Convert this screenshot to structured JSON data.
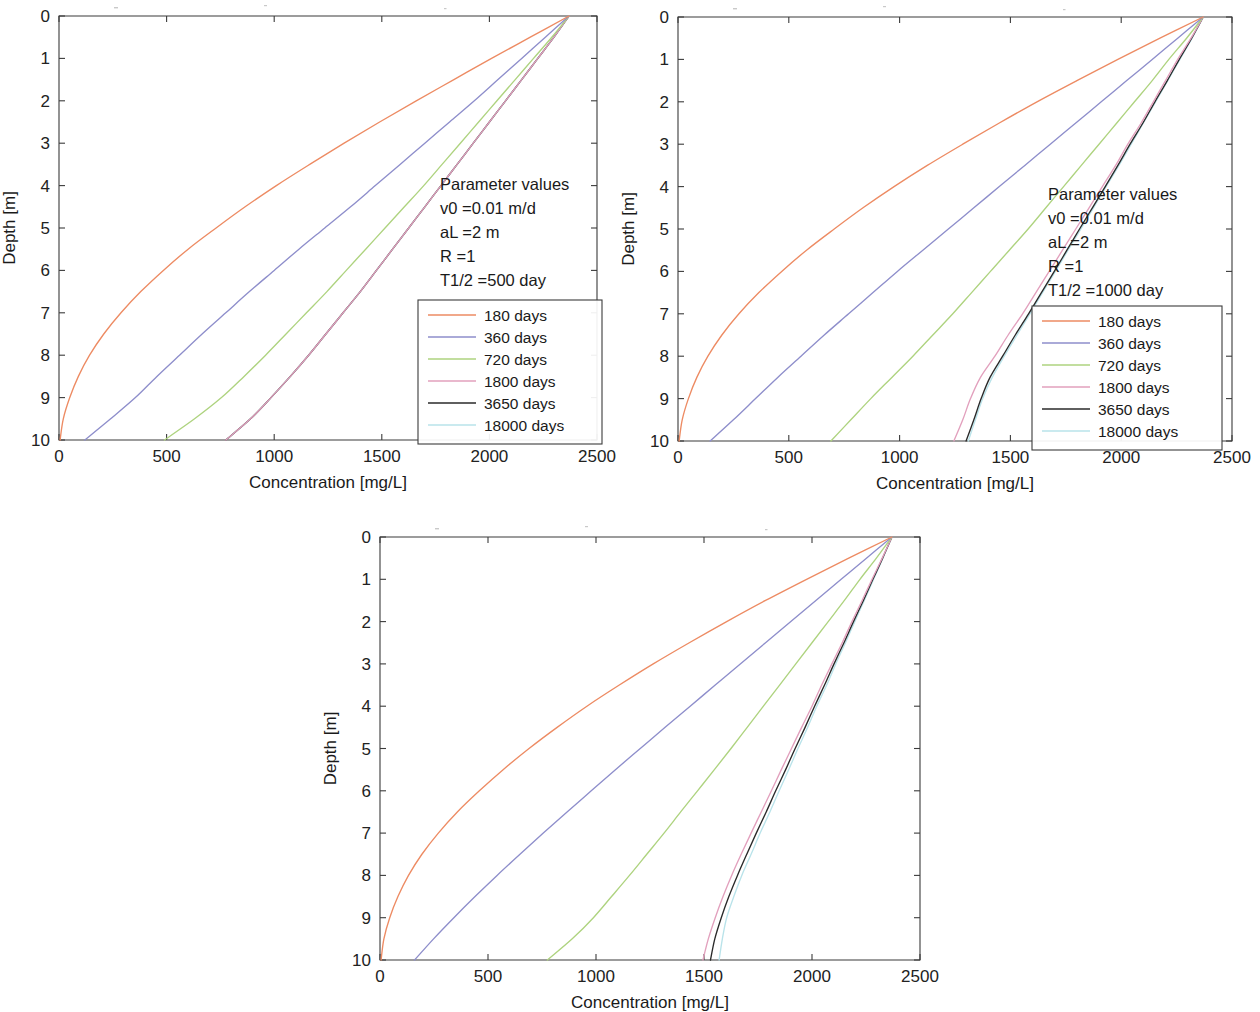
{
  "figure": {
    "title": "",
    "panel_count": 3
  },
  "axes": {
    "xlabel": "Concentration [mg/L]",
    "ylabel": "Depth [m]",
    "xticks": [
      0,
      500,
      1000,
      1500,
      2000,
      2500
    ],
    "yticks": [
      0,
      1,
      2,
      3,
      4,
      5,
      6,
      7,
      8,
      9,
      10
    ],
    "xlim": [
      0,
      2500
    ],
    "ylim": [
      0,
      10
    ],
    "y_inverted": true,
    "grid": false
  },
  "legend": {
    "position": "inside-right-middle",
    "entries": [
      {
        "label": "180 days",
        "color": "#ed8b63",
        "days": 180
      },
      {
        "label": "360 days",
        "color": "#8e8ecb",
        "days": 360
      },
      {
        "label": "720 days",
        "color": "#aed37f",
        "days": 720
      },
      {
        "label": "1800 days",
        "color": "#e2a0bd",
        "days": 1800
      },
      {
        "label": "3650 days",
        "color": "#2a2a2a",
        "days": 3650
      },
      {
        "label": "18000 days",
        "color": "#b9e3ea",
        "days": 18000
      }
    ]
  },
  "series_colors": {
    "180": "#ed8b63",
    "360": "#8e8ecb",
    "720": "#aed37f",
    "1800": "#e2a0bd",
    "3650": "#2a2a2a",
    "18000": "#b9e3ea"
  },
  "panels": [
    {
      "id": "panel-a",
      "params": {
        "heading": "Parameter values",
        "v0": "v0 =0.01 m/d",
        "aL": "aL =2 m",
        "R": "R =1",
        "halflife": "T1/2 =500 day"
      },
      "chart_data": {
        "type": "line",
        "title": "",
        "xlabel": "Concentration [mg/L]",
        "ylabel": "Depth [m]",
        "xlim": [
          0,
          2500
        ],
        "ylim": [
          0,
          10
        ],
        "y_inverted": true,
        "depths": [
          0,
          0.5,
          1,
          1.5,
          2,
          2.5,
          3,
          3.5,
          4,
          4.5,
          5,
          5.5,
          6,
          6.5,
          7,
          7.5,
          8,
          8.5,
          9,
          9.5,
          10
        ],
        "series": [
          {
            "name": "180 days",
            "color": "#ed8b63",
            "values": [
              2370,
              2190,
              2010,
              1835,
              1660,
              1490,
              1325,
              1165,
              1010,
              865,
              730,
              600,
              485,
              380,
              288,
              208,
              142,
              90,
              50,
              20,
              5
            ]
          },
          {
            "name": "360 days",
            "color": "#8e8ecb",
            "values": [
              2370,
              2260,
              2150,
              2040,
              1930,
              1815,
              1700,
              1585,
              1470,
              1355,
              1235,
              1115,
              1000,
              885,
              775,
              665,
              560,
              455,
              355,
              240,
              120
            ]
          },
          {
            "name": "720 days",
            "color": "#aed37f",
            "values": [
              2370,
              2290,
              2205,
              2120,
              2035,
              1950,
              1865,
              1780,
              1695,
              1605,
              1515,
              1425,
              1335,
              1245,
              1150,
              1055,
              960,
              860,
              755,
              630,
              490
            ]
          },
          {
            "name": "1800 days",
            "color": "#e2a0bd",
            "values": [
              2370,
              2300,
              2225,
              2150,
              2075,
              2000,
              1925,
              1850,
              1775,
              1700,
              1625,
              1550,
              1475,
              1400,
              1320,
              1240,
              1160,
              1075,
              985,
              890,
              775
            ]
          },
          {
            "name": "3650 days",
            "color": "#2a2a2a",
            "values": [
              2370,
              2300,
              2225,
              2150,
              2075,
              2000,
              1925,
              1850,
              1775,
              1700,
              1625,
              1550,
              1475,
              1400,
              1320,
              1240,
              1160,
              1075,
              985,
              890,
              775
            ]
          },
          {
            "name": "18000 days",
            "color": "#b9e3ea",
            "values": [
              2370,
              2300,
              2225,
              2150,
              2075,
              2000,
              1925,
              1850,
              1775,
              1700,
              1625,
              1550,
              1475,
              1400,
              1320,
              1240,
              1160,
              1075,
              985,
              890,
              775
            ]
          }
        ]
      }
    },
    {
      "id": "panel-b",
      "params": {
        "heading": "Parameter values",
        "v0": "v0 =0.01 m/d",
        "aL": "aL =2 m",
        "R": "R =1",
        "halflife": "T1/2 =1000 day"
      },
      "chart_data": {
        "type": "line",
        "title": "",
        "xlabel": "Concentration [mg/L]",
        "ylabel": "Depth [m]",
        "xlim": [
          0,
          2500
        ],
        "ylim": [
          0,
          10
        ],
        "y_inverted": true,
        "depths": [
          0,
          0.5,
          1,
          1.5,
          2,
          2.5,
          3,
          3.5,
          4,
          4.5,
          5,
          5.5,
          6,
          6.5,
          7,
          7.5,
          8,
          8.5,
          9,
          9.5,
          10
        ],
        "series": [
          {
            "name": "180 days",
            "color": "#ed8b63",
            "values": [
              2370,
              2175,
              1985,
              1800,
              1620,
              1450,
              1285,
              1125,
              975,
              835,
              705,
              580,
              468,
              365,
              275,
              198,
              135,
              85,
              47,
              19,
              5
            ]
          },
          {
            "name": "360 days",
            "color": "#8e8ecb",
            "values": [
              2370,
              2255,
              2140,
              2025,
              1910,
              1795,
              1680,
              1565,
              1450,
              1335,
              1220,
              1105,
              990,
              880,
              770,
              660,
              555,
              450,
              350,
              250,
              145
            ]
          },
          {
            "name": "720 days",
            "color": "#aed37f",
            "values": [
              2370,
              2295,
              2215,
              2140,
              2060,
              1980,
              1900,
              1820,
              1740,
              1660,
              1580,
              1495,
              1410,
              1325,
              1240,
              1150,
              1060,
              965,
              870,
              780,
              690
            ]
          },
          {
            "name": "1800 days",
            "color": "#e2a0bd",
            "values": [
              2370,
              2315,
              2255,
              2200,
              2145,
              2090,
              2030,
              1975,
              1915,
              1855,
              1795,
              1735,
              1675,
              1615,
              1555,
              1490,
              1430,
              1365,
              1320,
              1285,
              1245
            ]
          },
          {
            "name": "3650 days",
            "color": "#2a2a2a",
            "values": [
              2370,
              2318,
              2262,
              2208,
              2152,
              2098,
              2040,
              1985,
              1928,
              1870,
              1812,
              1755,
              1698,
              1640,
              1582,
              1522,
              1465,
              1408,
              1368,
              1335,
              1300
            ]
          },
          {
            "name": "18000 days",
            "color": "#b9e3ea",
            "values": [
              2370,
              2320,
              2265,
              2210,
              2155,
              2100,
              2045,
              1990,
              1932,
              1875,
              1818,
              1760,
              1703,
              1645,
              1588,
              1530,
              1472,
              1418,
              1375,
              1342,
              1310
            ]
          }
        ]
      }
    },
    {
      "id": "panel-c",
      "params": {
        "heading": "Parameter values",
        "v0": "v0 =0.01 m/d",
        "aL": "aL =2 m",
        "R": "R =1",
        "halflife": "T1/2 =1500 day"
      },
      "chart_data": {
        "type": "line",
        "title": "",
        "xlabel": "Concentration [mg/L]",
        "ylabel": "Depth [m]",
        "xlim": [
          0,
          2500
        ],
        "ylim": [
          0,
          10
        ],
        "y_inverted": true,
        "depths": [
          0,
          0.5,
          1,
          1.5,
          2,
          2.5,
          3,
          3.5,
          4,
          4.5,
          5,
          5.5,
          6,
          6.5,
          7,
          7.5,
          8,
          8.5,
          9,
          9.5,
          10
        ],
        "series": [
          {
            "name": "180 days",
            "color": "#ed8b63",
            "values": [
              2370,
              2170,
              1975,
              1785,
              1605,
              1432,
              1265,
              1108,
              958,
              820,
              690,
              570,
              460,
              358,
              270,
              194,
              132,
              83,
              45,
              18,
              5
            ]
          },
          {
            "name": "360 days",
            "color": "#8e8ecb",
            "values": [
              2370,
              2252,
              2135,
              2018,
              1902,
              1785,
              1668,
              1552,
              1436,
              1320,
              1205,
              1090,
              978,
              866,
              756,
              648,
              542,
              440,
              342,
              248,
              160
            ]
          },
          {
            "name": "720 days",
            "color": "#aed37f",
            "values": [
              2370,
              2298,
              2222,
              2150,
              2075,
              2000,
              1925,
              1850,
              1775,
              1700,
              1625,
              1548,
              1470,
              1392,
              1315,
              1235,
              1155,
              1072,
              988,
              890,
              775
            ]
          },
          {
            "name": "1800 days",
            "color": "#e2a0bd",
            "values": [
              2370,
              2325,
              2278,
              2232,
              2185,
              2140,
              2092,
              2045,
              2000,
              1952,
              1905,
              1858,
              1812,
              1765,
              1718,
              1672,
              1628,
              1588,
              1552,
              1520,
              1495
            ]
          },
          {
            "name": "3650 days",
            "color": "#2a2a2a",
            "values": [
              2370,
              2327,
              2282,
              2238,
              2192,
              2148,
              2102,
              2058,
              2012,
              1968,
              1922,
              1878,
              1832,
              1788,
              1742,
              1698,
              1655,
              1615,
              1580,
              1550,
              1530
            ]
          },
          {
            "name": "18000 days",
            "color": "#b9e3ea",
            "values": [
              2370,
              2328,
              2285,
              2242,
              2198,
              2155,
              2110,
              2068,
              2022,
              1980,
              1935,
              1892,
              1848,
              1805,
              1760,
              1718,
              1675,
              1638,
              1605,
              1585,
              1570
            ]
          }
        ]
      }
    }
  ]
}
